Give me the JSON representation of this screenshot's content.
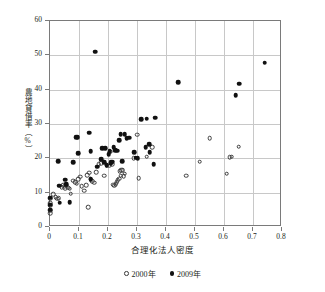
{
  "chart_data": {
    "type": "scatter",
    "title": "",
    "xlabel": "合理化法人密度",
    "ylabel": "農地貸借率（%）",
    "xlim": [
      0,
      0.8
    ],
    "ylim": [
      0,
      60
    ],
    "xticks": [
      "0",
      "0.1",
      "0.2",
      "0.3",
      "0.4",
      "0.5",
      "0.6",
      "0.7",
      "0.8"
    ],
    "xtick_values": [
      0,
      0.1,
      0.2,
      0.3,
      0.4,
      0.5,
      0.6,
      0.7,
      0.8
    ],
    "yticks": [
      "0",
      "10",
      "20",
      "30",
      "40",
      "50",
      "60"
    ],
    "ytick_values": [
      0,
      10,
      20,
      30,
      40,
      50,
      60
    ],
    "grid": "both",
    "legend_position": "bottom-center",
    "series": [
      {
        "name": "2000年",
        "marker": "open-circle",
        "color": "#3a3a3a",
        "points": [
          [
            0.0,
            8.3
          ],
          [
            0.0,
            7.0
          ],
          [
            0.0,
            6.2
          ],
          [
            0.0,
            4.8
          ],
          [
            0.0,
            4.0
          ],
          [
            0.012,
            9.6
          ],
          [
            0.02,
            8.6
          ],
          [
            0.025,
            8.3
          ],
          [
            0.03,
            8.4
          ],
          [
            0.04,
            11.6
          ],
          [
            0.045,
            12.1
          ],
          [
            0.05,
            11.9
          ],
          [
            0.052,
            11.3
          ],
          [
            0.058,
            12.0
          ],
          [
            0.062,
            11.4
          ],
          [
            0.068,
            11.2
          ],
          [
            0.072,
            9.7
          ],
          [
            0.08,
            13.5
          ],
          [
            0.086,
            13.1
          ],
          [
            0.092,
            12.6
          ],
          [
            0.098,
            14.0
          ],
          [
            0.104,
            14.6
          ],
          [
            0.11,
            11.9
          ],
          [
            0.118,
            10.6
          ],
          [
            0.124,
            12.2
          ],
          [
            0.128,
            15.1
          ],
          [
            0.132,
            5.8
          ],
          [
            0.136,
            15.8
          ],
          [
            0.14,
            13.9
          ],
          [
            0.146,
            13.3
          ],
          [
            0.152,
            12.9
          ],
          [
            0.16,
            16.0
          ],
          [
            0.168,
            18.3
          ],
          [
            0.176,
            18.5
          ],
          [
            0.186,
            14.9
          ],
          [
            0.196,
            18.0
          ],
          [
            0.204,
            17.9
          ],
          [
            0.208,
            21.9
          ],
          [
            0.214,
            18.3
          ],
          [
            0.218,
            12.3
          ],
          [
            0.222,
            12.0
          ],
          [
            0.226,
            12.5
          ],
          [
            0.23,
            13.0
          ],
          [
            0.234,
            13.6
          ],
          [
            0.238,
            14.1
          ],
          [
            0.24,
            16.2
          ],
          [
            0.244,
            15.0
          ],
          [
            0.246,
            16.5
          ],
          [
            0.25,
            16.6
          ],
          [
            0.254,
            14.8
          ],
          [
            0.258,
            15.5
          ],
          [
            0.288,
            20.1
          ],
          [
            0.3,
            26.9
          ],
          [
            0.306,
            14.2
          ],
          [
            0.334,
            20.5
          ],
          [
            0.352,
            23.3
          ],
          [
            0.47,
            14.9
          ],
          [
            0.516,
            19.0
          ],
          [
            0.55,
            25.8
          ],
          [
            0.61,
            15.5
          ],
          [
            0.62,
            20.4
          ],
          [
            0.626,
            20.5
          ],
          [
            0.65,
            23.4
          ]
        ]
      },
      {
        "name": "2009年",
        "marker": "filled-circle",
        "color": "#111111",
        "points": [
          [
            0.0,
            8.5
          ],
          [
            0.0,
            6.5
          ],
          [
            0.0,
            5.0
          ],
          [
            0.028,
            19.2
          ],
          [
            0.032,
            12.0
          ],
          [
            0.034,
            7.1
          ],
          [
            0.052,
            13.8
          ],
          [
            0.056,
            12.5
          ],
          [
            0.068,
            7.3
          ],
          [
            0.08,
            18.9
          ],
          [
            0.09,
            26.1
          ],
          [
            0.096,
            26.2
          ],
          [
            0.098,
            21.5
          ],
          [
            0.136,
            27.5
          ],
          [
            0.14,
            22.1
          ],
          [
            0.14,
            14.0
          ],
          [
            0.156,
            51.0
          ],
          [
            0.162,
            17.6
          ],
          [
            0.176,
            19.7
          ],
          [
            0.18,
            22.9
          ],
          [
            0.186,
            18.9
          ],
          [
            0.19,
            23.0
          ],
          [
            0.196,
            18.0
          ],
          [
            0.202,
            21.2
          ],
          [
            0.206,
            22.1
          ],
          [
            0.21,
            18.6
          ],
          [
            0.212,
            18.9
          ],
          [
            0.216,
            19.0
          ],
          [
            0.22,
            23.2
          ],
          [
            0.224,
            22.4
          ],
          [
            0.232,
            22.2
          ],
          [
            0.238,
            25.2
          ],
          [
            0.244,
            27.1
          ],
          [
            0.248,
            19.2
          ],
          [
            0.258,
            27.0
          ],
          [
            0.264,
            25.9
          ],
          [
            0.274,
            26.0
          ],
          [
            0.29,
            21.8
          ],
          [
            0.296,
            20.2
          ],
          [
            0.302,
            20.0
          ],
          [
            0.314,
            31.4
          ],
          [
            0.33,
            23.2
          ],
          [
            0.334,
            31.6
          ],
          [
            0.342,
            24.1
          ],
          [
            0.344,
            21.8
          ],
          [
            0.358,
            18.3
          ],
          [
            0.362,
            31.8
          ],
          [
            0.442,
            42.2
          ],
          [
            0.64,
            38.4
          ],
          [
            0.652,
            41.7
          ],
          [
            0.74,
            47.8
          ]
        ]
      }
    ]
  },
  "legend": {
    "items": [
      {
        "label": "2000年",
        "marker": "open-circle"
      },
      {
        "label": "2009年",
        "marker": "filled-circle"
      }
    ]
  }
}
